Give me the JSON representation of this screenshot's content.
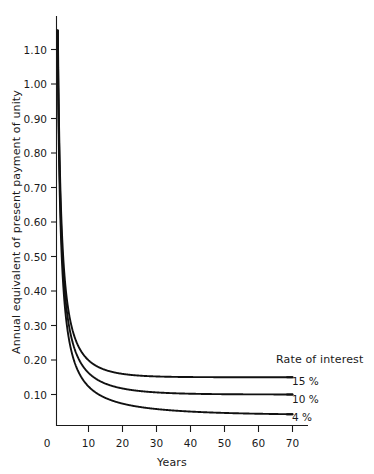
{
  "chart_data": {
    "type": "line",
    "title": "",
    "xlabel": "Years",
    "ylabel": "Annual equivalent of present payment of unity",
    "xlim": [
      0,
      74
    ],
    "ylim": [
      0,
      1.15
    ],
    "grid": false,
    "legend_position": "right-inside",
    "legend_title": "Rate of interest",
    "xticks": [
      0,
      10,
      20,
      30,
      40,
      50,
      60,
      70
    ],
    "xtick_labels": [
      "0",
      "10",
      "20",
      "30",
      "40",
      "50",
      "60",
      "70"
    ],
    "yticks": [
      0.1,
      0.2,
      0.3,
      0.4,
      0.5,
      0.6,
      0.7,
      0.8,
      0.9,
      1.0,
      1.1
    ],
    "ytick_labels": [
      "0.10",
      "0.20",
      "0.30",
      "0.40",
      "0.50",
      "0.60",
      "0.70",
      "0.80",
      "0.90",
      "1.00",
      "1.10"
    ],
    "x": [
      1,
      2,
      3,
      4,
      5,
      6,
      7,
      8,
      9,
      10,
      12,
      14,
      16,
      18,
      20,
      25,
      30,
      35,
      40,
      45,
      50,
      55,
      60,
      65,
      70
    ],
    "series": [
      {
        "name": "15 %",
        "label": "15 %",
        "rate": 0.15,
        "color": "#111111",
        "asymptote": 0.15,
        "values": [
          1.15,
          0.615,
          0.438,
          0.35,
          0.298,
          0.264,
          0.24,
          0.223,
          0.21,
          0.199,
          0.184,
          0.175,
          0.168,
          0.164,
          0.16,
          0.155,
          0.152,
          0.151,
          0.15,
          0.15,
          0.15,
          0.15,
          0.15,
          0.15,
          0.15
        ]
      },
      {
        "name": "10 %",
        "label": "10 %",
        "rate": 0.1,
        "color": "#111111",
        "asymptote": 0.1,
        "values": [
          1.1,
          0.576,
          0.402,
          0.315,
          0.264,
          0.23,
          0.205,
          0.187,
          0.174,
          0.163,
          0.147,
          0.136,
          0.128,
          0.122,
          0.117,
          0.11,
          0.106,
          0.104,
          0.102,
          0.101,
          0.101,
          0.101,
          0.1,
          0.1,
          0.1
        ]
      },
      {
        "name": "4 %",
        "label": "4 %",
        "rate": 0.04,
        "color": "#111111",
        "asymptote": 0.045,
        "values": [
          1.04,
          0.53,
          0.36,
          0.276,
          0.225,
          0.19,
          0.167,
          0.149,
          0.135,
          0.123,
          0.107,
          0.095,
          0.087,
          0.08,
          0.074,
          0.064,
          0.058,
          0.054,
          0.051,
          0.048,
          0.047,
          0.045,
          0.044,
          0.043,
          0.043
        ]
      }
    ]
  },
  "axes": {
    "ylabel": "Annual equivalent of present payment of unity",
    "xlabel": "Years",
    "ytick_labels": [
      "1.10",
      "1.00",
      "0.90",
      "0.80",
      "0.70",
      "0.60",
      "0.50",
      "0.40",
      "0.30",
      "0.20",
      "0.10"
    ],
    "xtick_labels": [
      "0",
      "10",
      "20",
      "30",
      "40",
      "50",
      "60",
      "70"
    ]
  },
  "legend": {
    "title": "Rate of interest",
    "entries": [
      {
        "label": "15 %"
      },
      {
        "label": "10 %"
      },
      {
        "label": "4 %"
      }
    ]
  }
}
